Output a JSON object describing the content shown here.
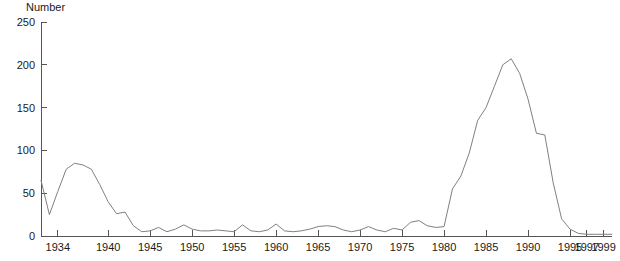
{
  "chart_data": {
    "type": "line",
    "title": "",
    "xlabel": "",
    "ylabel": "Number",
    "ylim": [
      0,
      250
    ],
    "xlim": [
      1932,
      2000
    ],
    "grid": false,
    "legend": null,
    "line_color": "#808080",
    "axis_color": "#555555",
    "ytick_labels": [
      "0",
      "50",
      "100",
      "150",
      "200",
      "250"
    ],
    "yticks": [
      0,
      50,
      100,
      150,
      200,
      250
    ],
    "xtick_labels": [
      "1934",
      "1940",
      "1945",
      "1950",
      "1955",
      "1960",
      "1965",
      "1970",
      "1975",
      "1980",
      "1985",
      "1990",
      "1995",
      "1997",
      "1999"
    ],
    "xticks": [
      1934,
      1940,
      1945,
      1950,
      1955,
      1960,
      1965,
      1970,
      1975,
      1980,
      1985,
      1990,
      1995,
      1997,
      1999
    ],
    "x": [
      1932,
      1933,
      1934,
      1935,
      1936,
      1937,
      1938,
      1939,
      1940,
      1941,
      1942,
      1943,
      1944,
      1945,
      1946,
      1947,
      1948,
      1949,
      1950,
      1951,
      1952,
      1953,
      1954,
      1955,
      1956,
      1957,
      1958,
      1959,
      1960,
      1961,
      1962,
      1963,
      1964,
      1965,
      1966,
      1967,
      1968,
      1969,
      1970,
      1971,
      1972,
      1973,
      1974,
      1975,
      1976,
      1977,
      1978,
      1979,
      1980,
      1981,
      1982,
      1983,
      1984,
      1985,
      1986,
      1987,
      1988,
      1989,
      1990,
      1991,
      1992,
      1993,
      1994,
      1995,
      1996,
      1997,
      1998,
      1999,
      2000
    ],
    "values": [
      65,
      25,
      52,
      78,
      85,
      83,
      78,
      60,
      40,
      26,
      28,
      12,
      5,
      6,
      10,
      5,
      8,
      13,
      8,
      6,
      6,
      7,
      6,
      5,
      13,
      6,
      5,
      7,
      14,
      6,
      5,
      6,
      8,
      11,
      12,
      11,
      7,
      5,
      7,
      11,
      7,
      5,
      9,
      7,
      16,
      18,
      12,
      10,
      11,
      55,
      70,
      97,
      135,
      150,
      175,
      200,
      207,
      190,
      160,
      120,
      118,
      62,
      20,
      8,
      3,
      2,
      2,
      2,
      2
    ],
    "series": [
      {
        "name": "Number",
        "values": [
          65,
          25,
          52,
          78,
          85,
          83,
          78,
          60,
          40,
          26,
          28,
          12,
          5,
          6,
          10,
          5,
          8,
          13,
          8,
          6,
          6,
          7,
          6,
          5,
          13,
          6,
          5,
          7,
          14,
          6,
          5,
          6,
          8,
          11,
          12,
          11,
          7,
          5,
          7,
          11,
          7,
          5,
          9,
          7,
          16,
          18,
          12,
          10,
          11,
          55,
          70,
          97,
          135,
          150,
          175,
          200,
          207,
          190,
          160,
          120,
          118,
          62,
          20,
          8,
          3,
          2,
          2,
          2,
          2
        ]
      }
    ]
  }
}
